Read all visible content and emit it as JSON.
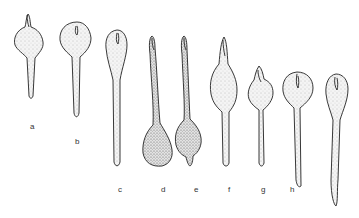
{
  "figure": {
    "shapes": [
      {
        "id": "a",
        "label": "a",
        "label_pos": [
          30,
          127
        ]
      },
      {
        "id": "b",
        "label": "b",
        "label_pos": [
          75,
          142
        ]
      },
      {
        "id": "c",
        "label": "c",
        "label_pos": [
          119,
          193
        ]
      },
      {
        "id": "d",
        "label": "d",
        "label_pos": [
          161,
          193
        ]
      },
      {
        "id": "e",
        "label": "e",
        "label_pos": [
          194,
          193
        ]
      },
      {
        "id": "f",
        "label": "f",
        "label_pos": [
          227,
          193
        ]
      },
      {
        "id": "g",
        "label": "g",
        "label_pos": [
          261,
          193
        ]
      },
      {
        "id": "h",
        "label": "h",
        "label_pos": [
          290,
          193
        ]
      },
      {
        "id": "i",
        "label": "",
        "label_pos": null
      }
    ]
  }
}
